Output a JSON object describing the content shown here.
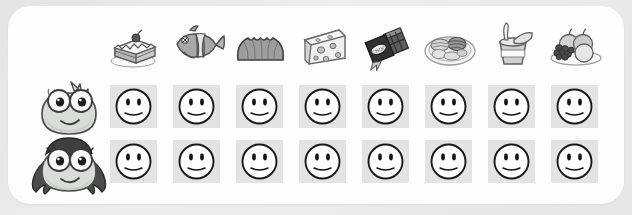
{
  "panel": {
    "background_color": "#fdfdfd",
    "page_background_color": "#e8e8e8",
    "title": ""
  },
  "columns": [
    {
      "id": "cake",
      "icon": "cake-slice-icon",
      "label": "Cake"
    },
    {
      "id": "fish",
      "icon": "fish-icon",
      "label": "Fish"
    },
    {
      "id": "bread",
      "icon": "bread-loaf-icon",
      "label": "Bread"
    },
    {
      "id": "cheese",
      "icon": "cheese-wedge-icon",
      "label": "Cheese"
    },
    {
      "id": "chocolate",
      "icon": "chocolate-bar-icon",
      "label": "Chocolate"
    },
    {
      "id": "vegetables",
      "icon": "vegetable-dish-icon",
      "label": "Vegetables"
    },
    {
      "id": "yogurt",
      "icon": "yogurt-cup-icon",
      "label": "Yogurt"
    },
    {
      "id": "fruit",
      "icon": "fruit-plate-icon",
      "label": "Fruit"
    }
  ],
  "rows": [
    {
      "id": "boy",
      "avatar": "boy-creature-avatar",
      "label": "Boy",
      "cells": [
        {
          "state": "neutral",
          "face": "neutral-smiley-icon"
        },
        {
          "state": "neutral",
          "face": "neutral-smiley-icon"
        },
        {
          "state": "neutral",
          "face": "neutral-smiley-icon"
        },
        {
          "state": "neutral",
          "face": "neutral-smiley-icon"
        },
        {
          "state": "neutral",
          "face": "neutral-smiley-icon"
        },
        {
          "state": "neutral",
          "face": "neutral-smiley-icon"
        },
        {
          "state": "neutral",
          "face": "neutral-smiley-icon"
        },
        {
          "state": "neutral",
          "face": "neutral-smiley-icon"
        }
      ]
    },
    {
      "id": "girl",
      "avatar": "girl-creature-avatar",
      "label": "Girl",
      "cells": [
        {
          "state": "neutral",
          "face": "neutral-smiley-icon"
        },
        {
          "state": "neutral",
          "face": "neutral-smiley-icon"
        },
        {
          "state": "neutral",
          "face": "neutral-smiley-icon"
        },
        {
          "state": "neutral",
          "face": "neutral-smiley-icon"
        },
        {
          "state": "neutral",
          "face": "neutral-smiley-icon"
        },
        {
          "state": "neutral",
          "face": "neutral-smiley-icon"
        },
        {
          "state": "neutral",
          "face": "neutral-smiley-icon"
        },
        {
          "state": "neutral",
          "face": "neutral-smiley-icon"
        }
      ]
    }
  ],
  "layout": {
    "column_x": [
      104,
      167,
      230,
      293,
      356,
      419,
      482,
      545
    ],
    "cell_x": [
      108,
      171,
      234,
      297,
      360,
      423,
      486,
      549
    ],
    "row_y": [
      85,
      140
    ],
    "avatar_y": [
      78,
      134
    ]
  },
  "colors": {
    "cell_background": "#e3e3e3",
    "face_fill": "#ffffff",
    "face_outline": "#1a1a1a",
    "avatar_body": "#d8dcd6",
    "avatar_hair": "#4a4a4a"
  }
}
